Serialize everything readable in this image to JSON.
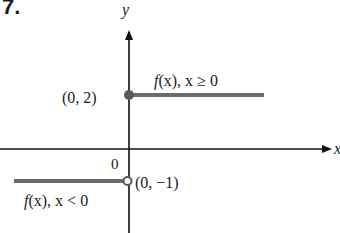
{
  "problem_number": "7.",
  "axes": {
    "x_label": "x",
    "y_label": "y",
    "origin_label": "0"
  },
  "points": {
    "closed": {
      "label": "(0, 2)",
      "x": 0,
      "y": 2,
      "filled": true
    },
    "open": {
      "label": "(0, −1)",
      "x": 0,
      "y": -1,
      "filled": false
    }
  },
  "pieces": {
    "right": {
      "label_f": "f",
      "label_rest": "(x), x ≥ 0",
      "label": "f(x), x ≥ 0",
      "y": 2,
      "domain": "x >= 0"
    },
    "left": {
      "label_f": "f",
      "label_rest": "(x), x < 0",
      "label": "f(x), x < 0",
      "y": -1,
      "domain": "x < 0"
    }
  },
  "colors": {
    "axis": "#111111",
    "graph_line": "#6b6b6b",
    "text": "#1a1a1a"
  }
}
